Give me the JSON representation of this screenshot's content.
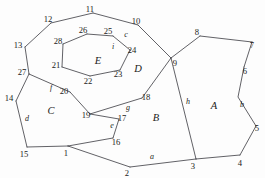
{
  "figure": {
    "kind": "planar-graph-diagram",
    "background_color": "#fdfdfd",
    "stroke_color": "#2e2e34",
    "text_color": "#1b1b20",
    "width": 265,
    "height": 178
  },
  "chart_data": {
    "type": "diagram",
    "title": "",
    "xlabel": "",
    "ylabel": "",
    "vertices": [
      {
        "id": "1",
        "label": "1",
        "x": 68,
        "y": 146,
        "label_x": 66,
        "label_y": 156
      },
      {
        "id": "2",
        "label": "2",
        "x": 130,
        "y": 167,
        "label_x": 127,
        "label_y": 176
      },
      {
        "id": "3",
        "label": "3",
        "x": 196,
        "y": 159,
        "label_x": 193,
        "label_y": 169
      },
      {
        "id": "4",
        "label": "4",
        "x": 240,
        "y": 155,
        "label_x": 240,
        "label_y": 166
      },
      {
        "id": "5",
        "label": "5",
        "x": 256,
        "y": 126,
        "label_x": 257,
        "label_y": 131
      },
      {
        "id": "6",
        "label": "6",
        "x": 244,
        "y": 67,
        "label_x": 245,
        "label_y": 74
      },
      {
        "id": "7",
        "label": "7",
        "x": 252,
        "y": 42,
        "label_x": 252,
        "label_y": 48
      },
      {
        "id": "8",
        "label": "8",
        "x": 200,
        "y": 36,
        "label_x": 197,
        "label_y": 35
      },
      {
        "id": "9",
        "label": "9",
        "x": 171,
        "y": 58,
        "label_x": 175,
        "label_y": 66
      },
      {
        "id": "10",
        "label": "10",
        "x": 138,
        "y": 25,
        "label_x": 136,
        "label_y": 24
      },
      {
        "id": "11",
        "label": "11",
        "x": 93,
        "y": 13,
        "label_x": 90,
        "label_y": 12
      },
      {
        "id": "12",
        "label": "12",
        "x": 51,
        "y": 23,
        "label_x": 48,
        "label_y": 22
      },
      {
        "id": "13",
        "label": "13",
        "x": 25,
        "y": 47,
        "label_x": 18,
        "label_y": 48
      },
      {
        "id": "14",
        "label": "14",
        "x": 16,
        "y": 101,
        "label_x": 9,
        "label_y": 101
      },
      {
        "id": "15",
        "label": "15",
        "x": 27,
        "y": 147,
        "label_x": 24,
        "label_y": 157
      },
      {
        "id": "16",
        "label": "16",
        "x": 113,
        "y": 138,
        "label_x": 116,
        "label_y": 145
      },
      {
        "id": "17",
        "label": "17",
        "x": 119,
        "y": 119,
        "label_x": 122,
        "label_y": 121
      },
      {
        "id": "18",
        "label": "18",
        "x": 142,
        "y": 98,
        "label_x": 146,
        "label_y": 100
      },
      {
        "id": "19",
        "label": "19",
        "x": 90,
        "y": 114,
        "label_x": 86,
        "label_y": 118
      },
      {
        "id": "20",
        "label": "20",
        "x": 70,
        "y": 92,
        "label_x": 64,
        "label_y": 94
      },
      {
        "id": "21",
        "label": "21",
        "x": 62,
        "y": 67,
        "label_x": 56,
        "label_y": 68
      },
      {
        "id": "22",
        "label": "22",
        "x": 90,
        "y": 76,
        "label_x": 88,
        "label_y": 84
      },
      {
        "id": "23",
        "label": "23",
        "x": 120,
        "y": 70,
        "label_x": 118,
        "label_y": 77
      },
      {
        "id": "24",
        "label": "24",
        "x": 130,
        "y": 50,
        "label_x": 132,
        "label_y": 53
      },
      {
        "id": "25",
        "label": "25",
        "x": 113,
        "y": 36,
        "label_x": 108,
        "label_y": 34
      },
      {
        "id": "26",
        "label": "26",
        "x": 87,
        "y": 34,
        "label_x": 83,
        "label_y": 33
      },
      {
        "id": "27",
        "label": "27",
        "x": 29,
        "y": 74,
        "label_x": 22,
        "label_y": 75
      },
      {
        "id": "28",
        "label": "28",
        "x": 63,
        "y": 44,
        "label_x": 58,
        "label_y": 44
      }
    ],
    "faces": [
      {
        "id": "A",
        "label": "A",
        "x": 214,
        "y": 109
      },
      {
        "id": "B",
        "label": "B",
        "x": 156,
        "y": 121
      },
      {
        "id": "C",
        "label": "C",
        "x": 51,
        "y": 114
      },
      {
        "id": "D",
        "label": "D",
        "x": 138,
        "y": 72
      },
      {
        "id": "E",
        "label": "E",
        "x": 98,
        "y": 64
      }
    ],
    "edge_labels": [
      {
        "id": "a",
        "label": "a",
        "x": 152,
        "y": 159
      },
      {
        "id": "b",
        "label": "b",
        "x": 242,
        "y": 107
      },
      {
        "id": "c",
        "label": "c",
        "x": 126,
        "y": 37
      },
      {
        "id": "d",
        "label": "d",
        "x": 27,
        "y": 121
      },
      {
        "id": "e",
        "label": "e",
        "x": 112,
        "y": 128
      },
      {
        "id": "f",
        "label": "f",
        "x": 51,
        "y": 90
      },
      {
        "id": "g",
        "label": "g",
        "x": 128,
        "y": 110
      },
      {
        "id": "h",
        "label": "h",
        "x": 188,
        "y": 104
      },
      {
        "id": "i",
        "label": "i",
        "x": 113,
        "y": 49
      }
    ],
    "edges": [
      {
        "id": "e-1-15",
        "from": "1",
        "to": "15",
        "points": "68,146 27,147"
      },
      {
        "id": "e-1-16",
        "from": "1",
        "to": "16",
        "points": "68,146 113,138"
      },
      {
        "id": "e-1-2",
        "from": "1",
        "to": "2",
        "points": "68,146 130,167"
      },
      {
        "id": "e-2-3",
        "from": "2",
        "to": "3",
        "points": "130,167 196,159"
      },
      {
        "id": "e-3-4",
        "from": "3",
        "to": "4",
        "points": "196,159 240,155"
      },
      {
        "id": "e-4-5",
        "from": "4",
        "to": "5",
        "points": "240,155 256,126"
      },
      {
        "id": "e-5-6",
        "from": "5",
        "to": "6",
        "points": "256,126 238,97 244,67"
      },
      {
        "id": "e-6-7",
        "from": "6",
        "to": "7",
        "points": "244,67 252,42"
      },
      {
        "id": "e-7-8",
        "from": "7",
        "to": "8",
        "points": "252,42 200,36"
      },
      {
        "id": "e-8-9",
        "from": "8",
        "to": "9",
        "points": "200,36 171,58"
      },
      {
        "id": "e-9-3",
        "from": "9",
        "to": "3",
        "points": "171,58 196,159"
      },
      {
        "id": "e-9-10",
        "from": "9",
        "to": "10",
        "points": "171,58 138,25"
      },
      {
        "id": "e-10-11",
        "from": "10",
        "to": "11",
        "points": "138,25 93,13"
      },
      {
        "id": "e-11-12",
        "from": "11",
        "to": "12",
        "points": "93,13 51,23"
      },
      {
        "id": "e-12-13",
        "from": "12",
        "to": "13",
        "points": "51,23 25,47"
      },
      {
        "id": "e-13-27",
        "from": "13",
        "to": "27",
        "points": "25,47 29,74"
      },
      {
        "id": "e-27-14",
        "from": "27",
        "to": "14",
        "points": "29,74 16,101"
      },
      {
        "id": "e-14-15",
        "from": "14",
        "to": "15",
        "points": "16,101 27,147"
      },
      {
        "id": "e-27-20",
        "from": "27",
        "to": "20",
        "points": "29,74 70,92"
      },
      {
        "id": "e-20-19",
        "from": "20",
        "to": "19",
        "points": "70,92 90,114"
      },
      {
        "id": "e-19-17",
        "from": "19",
        "to": "17",
        "points": "90,114 119,119"
      },
      {
        "id": "e-17-16",
        "from": "17",
        "to": "16",
        "points": "119,119 113,138"
      },
      {
        "id": "e-19-18",
        "from": "19",
        "to": "18",
        "points": "90,114 142,98"
      },
      {
        "id": "e-18-9",
        "from": "18",
        "to": "9",
        "points": "142,98 171,58"
      },
      {
        "id": "e-21-28",
        "from": "21",
        "to": "28",
        "points": "62,67 63,44"
      },
      {
        "id": "e-28-26",
        "from": "28",
        "to": "26",
        "points": "63,44 87,34"
      },
      {
        "id": "e-26-25",
        "from": "26",
        "to": "25",
        "points": "87,34 113,36"
      },
      {
        "id": "e-25-24",
        "from": "25",
        "to": "24",
        "points": "113,36 130,50"
      },
      {
        "id": "e-24-23",
        "from": "24",
        "to": "23",
        "points": "130,50 120,70"
      },
      {
        "id": "e-23-22",
        "from": "23",
        "to": "22",
        "points": "120,70 90,76"
      },
      {
        "id": "e-22-21",
        "from": "22",
        "to": "21",
        "points": "90,76 62,67"
      }
    ]
  }
}
